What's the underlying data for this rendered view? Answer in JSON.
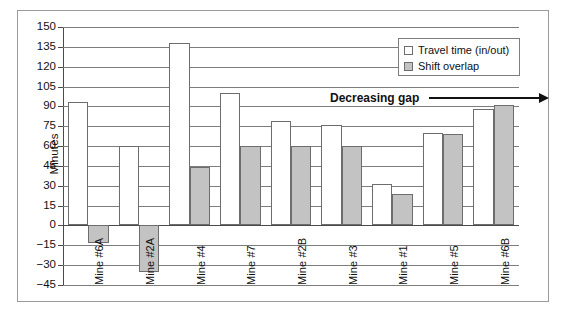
{
  "chart_data": {
    "type": "bar",
    "title": "",
    "xlabel": "",
    "ylabel": "Minutes",
    "ylim": [
      -45,
      150
    ],
    "ytick_step": 15,
    "yticks": [
      150,
      135,
      120,
      105,
      90,
      75,
      60,
      45,
      30,
      15,
      0,
      -15,
      -30,
      -45
    ],
    "ytick_labels": [
      "150",
      "135",
      "120",
      "105",
      "90",
      "75",
      "60",
      "45",
      "30",
      "15",
      "0",
      "−15",
      "−30",
      "−45"
    ],
    "grid": true,
    "legend_position": "top-right",
    "categories": [
      "Mine #6A",
      "Mine #2A",
      "Mine #4",
      "Mine #7",
      "Mine #2B",
      "Mine #3",
      "Mine #1",
      "Mine #5",
      "Mine #6B"
    ],
    "series": [
      {
        "name": "Travel time (in/out)",
        "color": "#ffffff",
        "values": [
          93,
          60,
          138,
          100,
          79,
          76,
          31,
          70,
          88
        ]
      },
      {
        "name": "Shift overlap",
        "color": "#c3c3c3",
        "values": [
          -13,
          -35,
          44,
          60,
          60,
          60,
          24,
          69,
          91
        ]
      }
    ],
    "annotations": [
      {
        "text": "Decreasing gap",
        "icon": "right-arrow-icon"
      }
    ]
  },
  "legend": {
    "items": [
      {
        "label": "Travel time (in/out)",
        "swatch": "white"
      },
      {
        "label": "Shift overlap",
        "swatch": "gray"
      }
    ]
  }
}
